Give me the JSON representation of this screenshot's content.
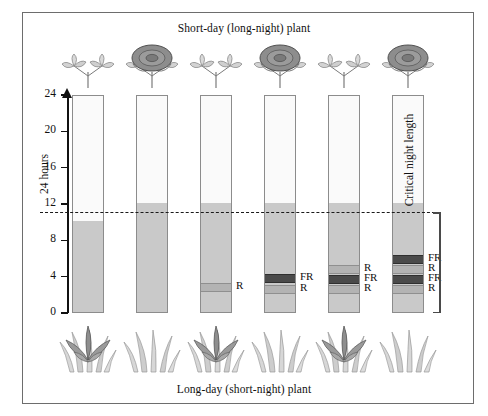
{
  "figure": {
    "title_top": "Short-day (long-night) plant",
    "title_bottom": "Long-day (short-night) plant",
    "y_axis_label": "24 hours",
    "critical_label": "Critical night length",
    "colors": {
      "day": "#fafafa",
      "night": "#c9c9c9",
      "red_flash": "#b3b3b3",
      "far_red_flash": "#4a4a4a",
      "outline": "#8c8c8c",
      "dashed_line": "#1a1a1a"
    }
  },
  "chart_data": {
    "type": "bar",
    "ylabel": "24 hours",
    "ylim": [
      0,
      24
    ],
    "yticks": [
      0,
      4,
      8,
      12,
      16,
      20,
      24
    ],
    "ytick_labels": [
      "0",
      "4",
      "8",
      "12",
      "16",
      "20",
      "24"
    ],
    "grid": false,
    "critical_night_length": 11,
    "annotations": [
      "Critical night length"
    ],
    "categories": [
      "1",
      "2",
      "3",
      "4",
      "5",
      "6"
    ],
    "series": [
      {
        "name": "night_length_hours",
        "values": [
          10,
          12,
          12,
          12,
          12,
          12
        ]
      }
    ],
    "bars": [
      {
        "id": 1,
        "night_hours": 10,
        "flashes": [],
        "short_day_plant_flowers": false,
        "long_day_plant_flowers": true
      },
      {
        "id": 2,
        "night_hours": 12,
        "flashes": [],
        "short_day_plant_flowers": true,
        "long_day_plant_flowers": false
      },
      {
        "id": 3,
        "night_hours": 12,
        "flashes": [
          {
            "type": "R",
            "label": "R",
            "hour": 3.0
          }
        ],
        "short_day_plant_flowers": false,
        "long_day_plant_flowers": true
      },
      {
        "id": 4,
        "night_hours": 12,
        "flashes": [
          {
            "type": "FR",
            "label": "FR",
            "hour": 4.0
          },
          {
            "type": "R",
            "label": "R",
            "hour": 2.8
          }
        ],
        "short_day_plant_flowers": true,
        "long_day_plant_flowers": false
      },
      {
        "id": 5,
        "night_hours": 12,
        "flashes": [
          {
            "type": "R",
            "label": "R",
            "hour": 5.0
          },
          {
            "type": "FR",
            "label": "FR",
            "hour": 3.9
          },
          {
            "type": "R",
            "label": "R",
            "hour": 2.8
          }
        ],
        "short_day_plant_flowers": false,
        "long_day_plant_flowers": true
      },
      {
        "id": 6,
        "night_hours": 12,
        "flashes": [
          {
            "type": "FR",
            "label": "FR",
            "hour": 6.1
          },
          {
            "type": "R",
            "label": "R",
            "hour": 5.0
          },
          {
            "type": "FR",
            "label": "FR",
            "hour": 3.9
          },
          {
            "type": "R",
            "label": "R",
            "hour": 2.8
          }
        ],
        "short_day_plant_flowers": true,
        "long_day_plant_flowers": false
      }
    ]
  }
}
